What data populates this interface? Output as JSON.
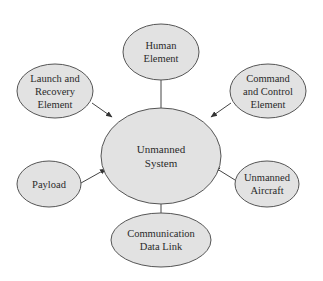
{
  "diagram": {
    "type": "hub-and-spoke",
    "colors": {
      "node_fill": "#e2e2e2",
      "node_stroke": "#555555",
      "edge": "#444444",
      "text": "#2a2a2a",
      "background": "#ffffff"
    },
    "center": {
      "id": "unmanned-system",
      "lines": [
        "Unmanned",
        "System"
      ]
    },
    "nodes": [
      {
        "id": "human-element",
        "lines": [
          "Human",
          "Element"
        ]
      },
      {
        "id": "launch-recovery-element",
        "lines": [
          "Launch and",
          "Recovery",
          "Element"
        ]
      },
      {
        "id": "command-control-element",
        "lines": [
          "Command",
          "and Control",
          "Element"
        ]
      },
      {
        "id": "payload",
        "lines": [
          "Payload"
        ]
      },
      {
        "id": "unmanned-aircraft",
        "lines": [
          "Unmanned",
          "Aircraft"
        ]
      },
      {
        "id": "communication-data-link",
        "lines": [
          "Communication",
          "Data Link"
        ]
      }
    ],
    "edges": [
      {
        "from": "human-element",
        "to": "unmanned-system"
      },
      {
        "from": "launch-recovery-element",
        "to": "unmanned-system"
      },
      {
        "from": "command-control-element",
        "to": "unmanned-system"
      },
      {
        "from": "payload",
        "to": "unmanned-system"
      },
      {
        "from": "unmanned-aircraft",
        "to": "unmanned-system"
      },
      {
        "from": "communication-data-link",
        "to": "unmanned-system"
      }
    ]
  }
}
